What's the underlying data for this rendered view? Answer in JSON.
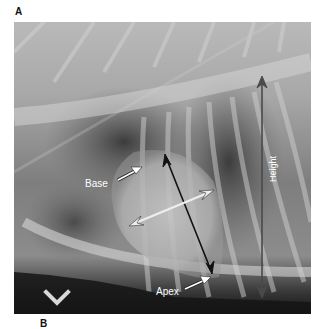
{
  "figure": {
    "panel_label": "A",
    "next_panel_label": "B",
    "annotations": {
      "base": "Base",
      "apex": "Apex",
      "height": "Height"
    },
    "arrow_colors": {
      "long_axis": "#111111",
      "short_axis": "#e8e8e8",
      "height": "#4a4a4a"
    }
  }
}
